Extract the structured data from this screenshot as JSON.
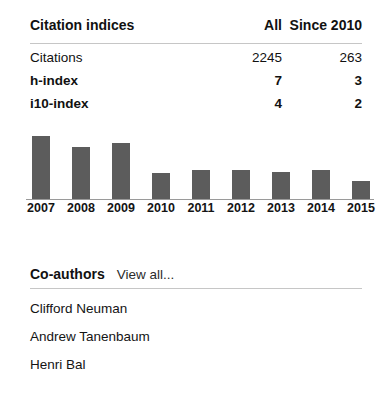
{
  "citation_indices": {
    "title": "Citation indices",
    "columns": [
      "All",
      "Since 2010"
    ],
    "rows": [
      {
        "label": "Citations",
        "all": "2245",
        "since_2010": "263"
      },
      {
        "label": "h-index",
        "all": "7",
        "since_2010": "3"
      },
      {
        "label": "i10-index",
        "all": "4",
        "since_2010": "2"
      }
    ]
  },
  "chart_data": {
    "type": "bar",
    "title": "",
    "xlabel": "",
    "ylabel": "",
    "categories": [
      "2007",
      "2008",
      "2009",
      "2010",
      "2011",
      "2012",
      "2013",
      "2014",
      "2015"
    ],
    "values": [
      63,
      52,
      56,
      26,
      29,
      29,
      27,
      29,
      18
    ],
    "ylim": [
      0,
      63
    ],
    "grid": false,
    "legend": false,
    "bar_color": "#5c5c5c",
    "axis_color": "#9a9a9a"
  },
  "coauthors": {
    "title": "Co-authors",
    "view_all_label": "View all...",
    "items": [
      {
        "name": "Clifford Neuman"
      },
      {
        "name": "Andrew Tanenbaum"
      },
      {
        "name": "Henri Bal"
      }
    ]
  }
}
